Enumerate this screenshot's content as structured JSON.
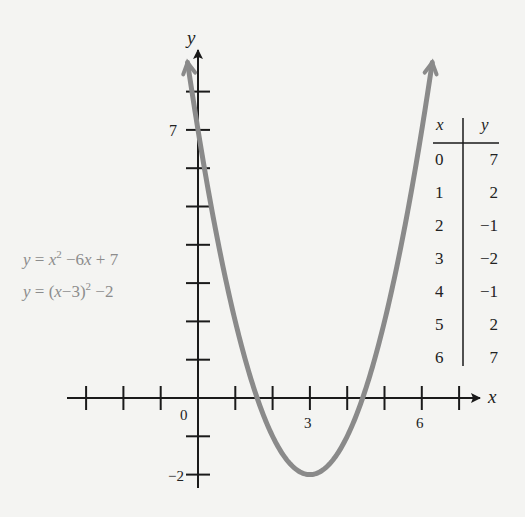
{
  "chart_data": {
    "type": "line",
    "title": "",
    "xlabel": "x",
    "ylabel": "y",
    "series": [
      {
        "name": "y = x^2 - 6x + 7",
        "function": "x^2 - 6x + 7",
        "vertex_form": "(x-3)^2 - 2",
        "vertex": [
          3,
          -2
        ],
        "x": [
          0,
          1,
          2,
          3,
          4,
          5,
          6
        ],
        "values": [
          7,
          2,
          -1,
          -2,
          -1,
          2,
          7
        ],
        "color": "#8a8a8a"
      }
    ],
    "x_tick_labels": [
      "0",
      "3",
      "6"
    ],
    "y_tick_labels": [
      "7",
      "-2"
    ],
    "xlim": [
      -3,
      7
    ],
    "ylim": [
      -2,
      8
    ],
    "grid": false,
    "table": {
      "headers": [
        "x",
        "y"
      ],
      "rows": [
        [
          "0",
          "7"
        ],
        [
          "1",
          "2"
        ],
        [
          "2",
          "−1"
        ],
        [
          "3",
          "−2"
        ],
        [
          "4",
          "−1"
        ],
        [
          "5",
          "2"
        ],
        [
          "6",
          "7"
        ]
      ]
    }
  },
  "axes": {
    "x_label": "x",
    "y_label": "y",
    "origin_label": "0",
    "x_tick_3": "3",
    "x_tick_6": "6",
    "y_tick_7": "7",
    "y_tick_neg2": "−2"
  },
  "equations": {
    "standard": {
      "lhs": "y",
      "eq": " = ",
      "x": "x",
      "exp": "2",
      "rest": " −6",
      "x2": "x",
      "tail": " + 7"
    },
    "vertex": {
      "lhs": "y",
      "eq": " = (",
      "x": "x",
      "mid": "−3)",
      "exp": "2",
      "tail": " −2"
    }
  },
  "table": {
    "header_x": "x",
    "header_y": "y",
    "rows": [
      {
        "x": "0",
        "y": "7"
      },
      {
        "x": "1",
        "y": "2"
      },
      {
        "x": "2",
        "y": "−1"
      },
      {
        "x": "3",
        "y": "−2"
      },
      {
        "x": "4",
        "y": "−1"
      },
      {
        "x": "5",
        "y": "2"
      },
      {
        "x": "6",
        "y": "7"
      }
    ]
  },
  "colors": {
    "curve": "#8a8a8a",
    "axes": "#1a1a1a",
    "equation_text": "#8c8c8c",
    "background": "#f4f4f2"
  }
}
